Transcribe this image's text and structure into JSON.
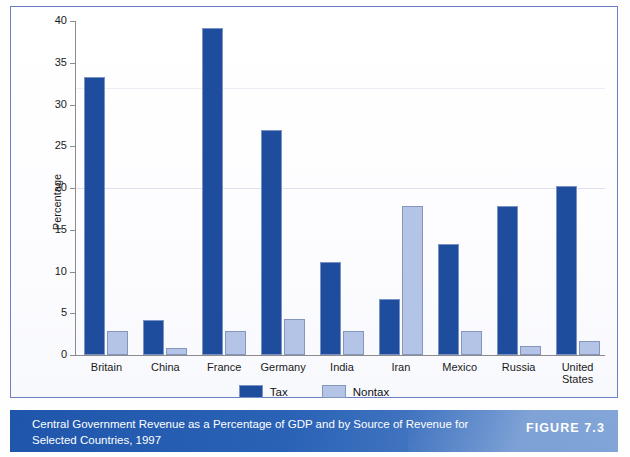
{
  "caption": {
    "text": "Central Government Revenue as a Percentage of GDP and by Source of Revenue for Selected Countries, 1997",
    "figure_number": "FIGURE 7.3"
  },
  "legend": {
    "items": [
      {
        "label": "Tax",
        "color": "#1e4d9e"
      },
      {
        "label": "Nontax",
        "color": "#b3c4e6"
      }
    ]
  },
  "colors": {
    "tax": "#1e4d9e",
    "nontax": "#b3c4e6",
    "caption_bar": "#2a62b6",
    "frame_border": "#6a7fc4"
  },
  "chart_data": {
    "type": "bar",
    "title": "Central Government Revenue as a Percentage of GDP and by Source of Revenue for Selected Countries, 1997",
    "xlabel": "",
    "ylabel": "Percentage",
    "ylim": [
      0,
      40
    ],
    "yticks": [
      0,
      5,
      10,
      15,
      20,
      25,
      30,
      35,
      40
    ],
    "grid": false,
    "legend_position": "bottom-center",
    "categories": [
      "Britain",
      "China",
      "France",
      "Germany",
      "India",
      "Iran",
      "Mexico",
      "Russia",
      "United States"
    ],
    "series": [
      {
        "name": "Tax",
        "values": [
          33.3,
          4.2,
          39.2,
          27.0,
          11.1,
          6.7,
          13.3,
          17.9,
          20.2
        ]
      },
      {
        "name": "Nontax",
        "values": [
          2.9,
          0.9,
          2.9,
          4.3,
          2.9,
          17.8,
          2.9,
          1.1,
          1.7
        ]
      }
    ]
  }
}
